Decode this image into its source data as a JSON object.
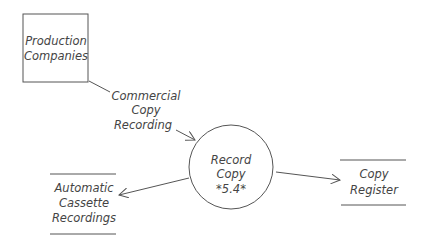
{
  "diagram": {
    "type": "data-flow-diagram",
    "entities": [
      {
        "id": "production",
        "shape": "rectangle",
        "lines": [
          "Production",
          "Companies"
        ]
      }
    ],
    "processes": [
      {
        "id": "record-copy",
        "shape": "circle",
        "lines": [
          "Record",
          "Copy",
          "*5.4*"
        ]
      }
    ],
    "stores": [
      {
        "id": "copy-register",
        "shape": "open-rectangle",
        "lines": [
          "Copy",
          "Register"
        ]
      },
      {
        "id": "auto-cassette",
        "shape": "open-rectangle",
        "lines": [
          "Automatic",
          "Cassette",
          "Recordings"
        ]
      }
    ],
    "flows": [
      {
        "from": "production",
        "to": "record-copy",
        "lines": [
          "Commercial",
          "Copy",
          "Recording"
        ]
      },
      {
        "from": "record-copy",
        "to": "copy-register",
        "lines": []
      },
      {
        "from": "record-copy",
        "to": "auto-cassette",
        "lines": []
      }
    ],
    "colors": {
      "stroke": "#555555",
      "text": "#444444",
      "background": "#ffffff"
    }
  }
}
